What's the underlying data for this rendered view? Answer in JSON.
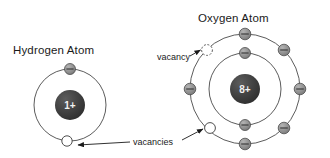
{
  "figure": {
    "background_color": "#ffffff"
  },
  "colors": {
    "nucleus_fill": "#3f3f3f",
    "nucleus_text": "#f2f2f2",
    "electron_fill": "#8a8a8a",
    "electron_stroke": "#4d4d4d",
    "orbit_stroke": "#4a4a4a",
    "vacancy_fill": "#ffffff",
    "vacancy_stroke": "#3b3b3b",
    "label_text": "#1a1a1a",
    "leader_line": "#1a1a1a"
  },
  "atoms": [
    {
      "id": "hydrogen",
      "title": "Hydrogen Atom",
      "title_position": {
        "x": 13,
        "y": 54
      },
      "nucleus": {
        "label": "1+",
        "cx": 70,
        "cy": 105,
        "r": 15
      },
      "shells": [
        {
          "name": "shell-1",
          "r": 36,
          "electron_count": 1,
          "vacancy_count": 1
        }
      ],
      "electrons": [
        {
          "name": "hydrogen-electron-1",
          "cx": 70,
          "cy": 69,
          "r": 5.5,
          "charge": "minus"
        }
      ],
      "vacancies": [
        {
          "name": "hydrogen-vacancy-1",
          "cx": 67,
          "cy": 141,
          "r": 5.2,
          "style": "solid"
        }
      ]
    },
    {
      "id": "oxygen",
      "title": "Oxygen Atom",
      "title_position": {
        "x": 198,
        "y": 22
      },
      "nucleus": {
        "label": "8+",
        "cx": 245,
        "cy": 89,
        "r": 15
      },
      "shells": [
        {
          "name": "inner-shell",
          "r": 36,
          "electron_count": 2,
          "vacancy_count": 0
        },
        {
          "name": "outer-shell",
          "r": 55,
          "electron_count": 6,
          "vacancy_count": 2
        }
      ],
      "electrons": [
        {
          "name": "oxygen-inner-electron-1",
          "cx": 245,
          "cy": 53,
          "r": 5.5,
          "charge": "minus"
        },
        {
          "name": "oxygen-inner-electron-2",
          "cx": 245,
          "cy": 125,
          "r": 5.5,
          "charge": "minus"
        },
        {
          "name": "oxygen-outer-electron-1",
          "cx": 245,
          "cy": 34,
          "r": 5.8,
          "charge": "minus"
        },
        {
          "name": "oxygen-outer-electron-2",
          "cx": 284,
          "cy": 50,
          "r": 5.8,
          "charge": "minus"
        },
        {
          "name": "oxygen-outer-electron-3",
          "cx": 300,
          "cy": 89,
          "r": 5.8,
          "charge": "minus"
        },
        {
          "name": "oxygen-outer-electron-4",
          "cx": 284,
          "cy": 128,
          "r": 5.8,
          "charge": "minus"
        },
        {
          "name": "oxygen-outer-electron-5",
          "cx": 245,
          "cy": 144,
          "r": 5.8,
          "charge": "minus"
        },
        {
          "name": "oxygen-outer-electron-6",
          "cx": 190,
          "cy": 89,
          "r": 5.8,
          "charge": "minus"
        }
      ],
      "vacancies": [
        {
          "name": "oxygen-vacancy-top",
          "cx": 207,
          "cy": 50,
          "r": 5.4,
          "style": "dashed"
        },
        {
          "name": "oxygen-vacancy-bottom",
          "cx": 210,
          "cy": 128,
          "r": 5.4,
          "style": "solid"
        }
      ]
    }
  ],
  "callouts": [
    {
      "id": "vacancy-callout",
      "label": "vacancy",
      "text_position": {
        "x": 157,
        "y": 60
      },
      "target": "oxygen-vacancy-top"
    },
    {
      "id": "vacancies-callout",
      "label": "vacancies",
      "text_position": {
        "x": 133,
        "y": 145
      },
      "targets": [
        "hydrogen-vacancy-1",
        "oxygen-vacancy-bottom"
      ]
    }
  ]
}
